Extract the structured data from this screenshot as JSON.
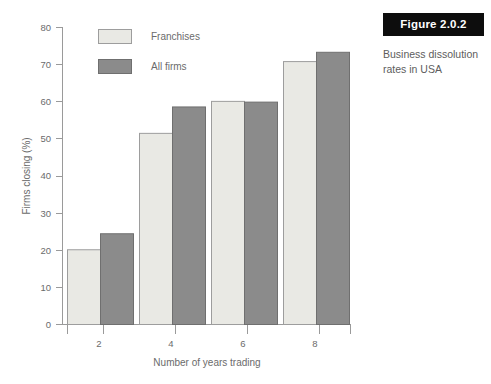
{
  "figure": {
    "label": "Figure 2.0.2",
    "caption": "Business dissolution rates in USA"
  },
  "chart_data": {
    "type": "bar",
    "title": "",
    "xlabel": "Number of years trading",
    "ylabel": "Firms closing (%)",
    "categories": [
      "2",
      "4",
      "6",
      "8"
    ],
    "series": [
      {
        "name": "Franchises",
        "color": "#e9e9e4",
        "values": [
          20.1,
          51.4,
          60.0,
          70.7
        ]
      },
      {
        "name": "All firms",
        "color": "#8b8b8b",
        "values": [
          24.4,
          58.5,
          59.8,
          73.2
        ]
      }
    ],
    "ylim": [
      0,
      80
    ],
    "yticks": [
      "0",
      "10",
      "20",
      "30",
      "40",
      "50",
      "60",
      "70",
      "80"
    ],
    "xticks": [
      "2",
      "4",
      "6",
      "8"
    ],
    "grid": false,
    "legend_position": "top-left"
  }
}
